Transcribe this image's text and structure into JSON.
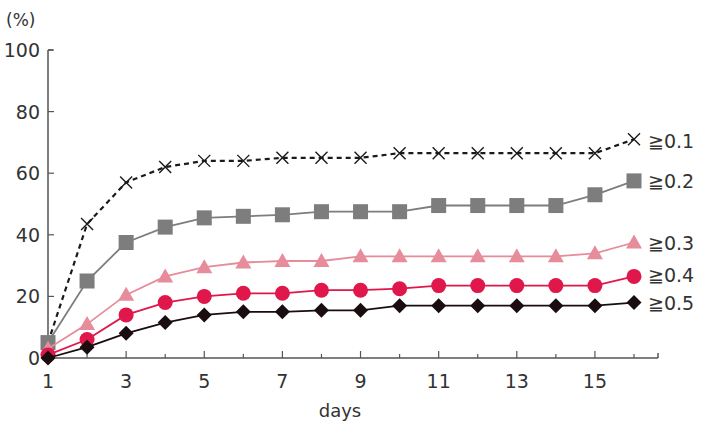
{
  "chart_data": {
    "type": "line",
    "title": "",
    "xlabel": "days",
    "ylabel": "(%)",
    "x": [
      1,
      2,
      3,
      4,
      5,
      6,
      7,
      8,
      9,
      10,
      11,
      12,
      13,
      14,
      15,
      16
    ],
    "x_tick_labels": [
      "1",
      "3",
      "5",
      "7",
      "9",
      "11",
      "13",
      "15"
    ],
    "x_ticks_minor": [
      1,
      2,
      3,
      4,
      5,
      6,
      7,
      8,
      9,
      10,
      11,
      12,
      13,
      14,
      15,
      16
    ],
    "y_tick_labels": [
      "0",
      "20",
      "40",
      "60",
      "80",
      "100"
    ],
    "ylim": [
      0,
      100
    ],
    "xlim": [
      1,
      16
    ],
    "grid": false,
    "legend_position": "inline-right",
    "series": [
      {
        "name": "≧0.1",
        "marker": "x",
        "line_style": "dashed",
        "color": "#1a1a1a",
        "values": [
          5,
          43.5,
          57,
          62,
          64,
          64,
          65,
          65,
          65,
          66.5,
          66.5,
          66.5,
          66.5,
          66.5,
          66.5,
          71
        ]
      },
      {
        "name": "≧0.2",
        "marker": "square",
        "line_style": "solid",
        "color": "#7d7d7d",
        "values": [
          5,
          25,
          37.5,
          42.5,
          45.5,
          46,
          46.5,
          47.5,
          47.5,
          47.5,
          49.5,
          49.5,
          49.5,
          49.5,
          53,
          57.5
        ]
      },
      {
        "name": "≧0.3",
        "marker": "triangle",
        "line_style": "solid",
        "color": "#e68c9a",
        "values": [
          3,
          11,
          20.5,
          26.5,
          29.5,
          31,
          31.5,
          31.5,
          33,
          33,
          33,
          33,
          33,
          33,
          34,
          37.5
        ]
      },
      {
        "name": "≧0.4",
        "marker": "circle",
        "line_style": "solid",
        "color": "#e0174a",
        "values": [
          1,
          6,
          14,
          18,
          20,
          21,
          21,
          22,
          22,
          22.5,
          23.5,
          23.5,
          23.5,
          23.5,
          23.5,
          26.5
        ]
      },
      {
        "name": "≧0.5",
        "marker": "diamond",
        "line_style": "solid",
        "color": "#1a0d10",
        "values": [
          0,
          3.5,
          8,
          11.5,
          14,
          15,
          15,
          15.5,
          15.5,
          17,
          17,
          17,
          17,
          17,
          17,
          18
        ]
      }
    ]
  }
}
